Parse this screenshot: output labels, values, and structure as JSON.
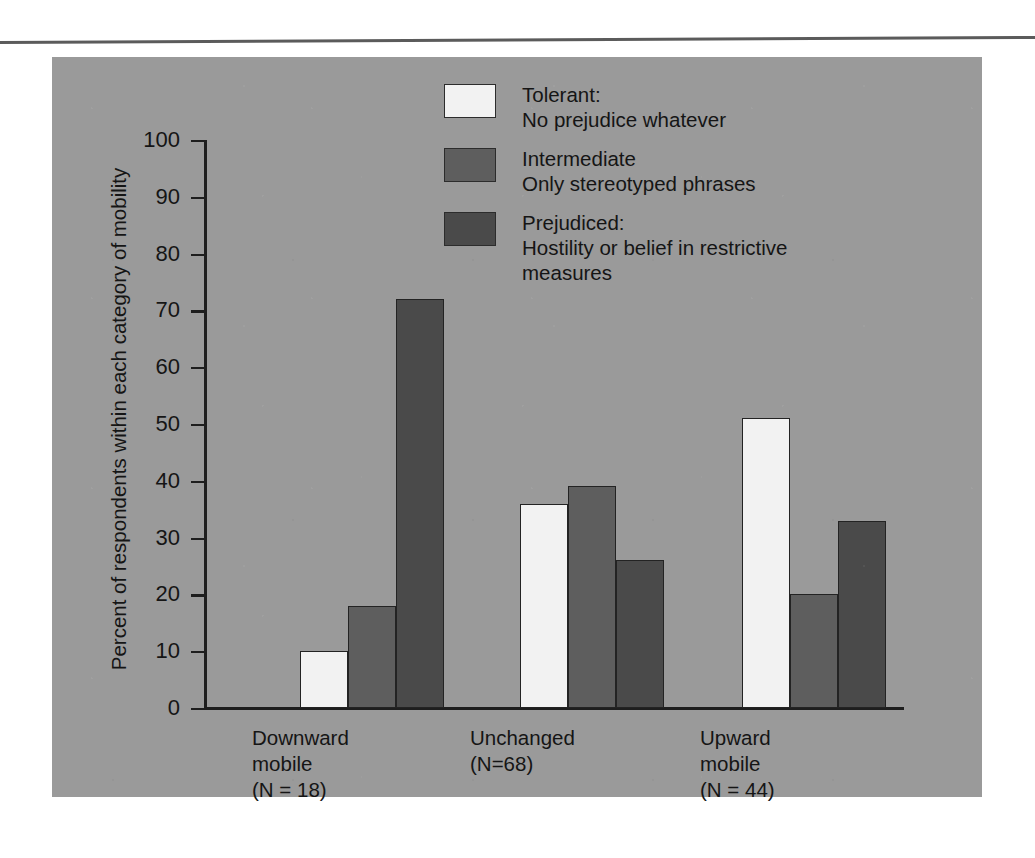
{
  "page": {
    "background_color": "#ffffff",
    "panel_color": "#9a9a9a",
    "rule_color": "#5b5b5b"
  },
  "colors": {
    "tolerant": "#f2f2f2",
    "intermediate": "#5e5e5e",
    "prejudiced": "#4a4a4a",
    "axis": "#1e1e1e",
    "text": "#151515"
  },
  "legend": {
    "items": [
      {
        "swatch": "tolerant",
        "title": "Tolerant:",
        "description": "No prejudice whatever",
        "text": "Tolerant:\nNo prejudice whatever"
      },
      {
        "swatch": "intermediate",
        "title": "Intermediate",
        "description": "Only stereotyped phrases",
        "text": "Intermediate\nOnly stereotyped phrases"
      },
      {
        "swatch": "prejudiced",
        "title": "Prejudiced:",
        "description": "Hostility or belief in restrictive measures",
        "text": "Prejudiced:\nHostility or belief in restrictive\nmeasures"
      }
    ]
  },
  "axis": {
    "y_title": "Percent of respondents within each category of mobility",
    "y_ticks": [
      "100",
      "90",
      "80",
      "70",
      "60",
      "50",
      "40",
      "30",
      "20",
      "10",
      "0"
    ]
  },
  "groups": [
    {
      "name": "Downward mobile",
      "label": "Downward\nmobile\n(N = 18)",
      "n": 18
    },
    {
      "name": "Unchanged",
      "label": "Unchanged\n(N=68)",
      "n": 68
    },
    {
      "name": "Upward mobile",
      "label": "Upward\nmobile\n(N = 44)",
      "n": 44
    }
  ],
  "chart_data": {
    "type": "bar",
    "title": "",
    "xlabel": "",
    "ylabel": "Percent of respondents within each category of mobility",
    "ylim": [
      0,
      100
    ],
    "ytick_step": 10,
    "grid": false,
    "legend_position": "top-center",
    "categories": [
      "Downward mobile (N = 18)",
      "Unchanged (N=68)",
      "Upward mobile (N = 44)"
    ],
    "series": [
      {
        "name": "Tolerant: No prejudice whatever",
        "color": "#f2f2f2",
        "values": [
          10,
          36,
          51
        ]
      },
      {
        "name": "Intermediate Only stereotyped phrases",
        "color": "#5e5e5e",
        "values": [
          18,
          39,
          20
        ]
      },
      {
        "name": "Prejudiced: Hostility or belief in restrictive measures",
        "color": "#4a4a4a",
        "values": [
          72,
          26,
          33
        ]
      }
    ]
  }
}
